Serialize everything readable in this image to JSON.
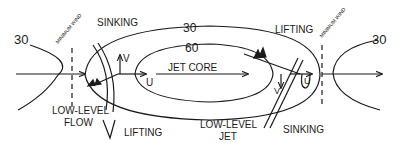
{
  "diagram": {
    "type": "jet-streak-schematic",
    "colors": {
      "ink": "#1a1a1a",
      "background": "#ffffff"
    },
    "isotach_labels": {
      "outer": "30",
      "inner": "60",
      "left_trough": "30",
      "right_ridge": "30"
    },
    "minimum_wind_label_left": "MINIMUM WIND",
    "minimum_wind_label_right": "MINIMUM WIND",
    "labels": {
      "sinking_top_left": "SINKING",
      "lifting_top_right": "LIFTING",
      "lifting_bottom_left": "LIFTING",
      "sinking_bottom_right": "SINKING",
      "jet_core": "JET CORE",
      "low_level_flow_1": "LOW-LEVEL",
      "low_level_flow_2": "FLOW",
      "low_level_jet_1": "LOW-LEVEL",
      "low_level_jet_2": "JET",
      "u_left": "U",
      "v_left": "V",
      "u_right": "U",
      "v_right": "V"
    }
  }
}
